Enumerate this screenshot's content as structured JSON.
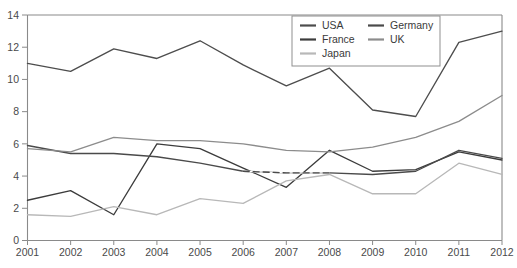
{
  "chart_data": {
    "type": "line",
    "title": "",
    "subtitle": "",
    "xlabel": "",
    "ylabel": "",
    "x": [
      2001,
      2002,
      2003,
      2004,
      2005,
      2006,
      2007,
      2008,
      2009,
      2010,
      2011,
      2012
    ],
    "xtick_labels": [
      "2001",
      "2002",
      "2003",
      "2004",
      "2005",
      "2006",
      "2007",
      "2008",
      "2009",
      "2010",
      "2011",
      "2012"
    ],
    "ytick_labels": [
      "0",
      "2",
      "4",
      "6",
      "8",
      "10",
      "12",
      "14"
    ],
    "yticks": [
      0,
      2,
      4,
      6,
      8,
      10,
      12,
      14
    ],
    "xlim": [
      2001,
      2012
    ],
    "ylim": [
      0,
      14
    ],
    "grid": false,
    "legend_position": "top-right",
    "legend_columns": 2,
    "series": [
      {
        "name": "USA",
        "color": "#4d4d4d",
        "dash": "none",
        "values": [
          11.0,
          10.5,
          11.9,
          11.3,
          12.4,
          10.9,
          9.6,
          10.7,
          8.1,
          7.7,
          12.3,
          13.0
        ]
      },
      {
        "name": "France",
        "color": "#3c3c3c",
        "dash": "none",
        "values": [
          2.5,
          3.1,
          1.6,
          6.0,
          5.7,
          4.5,
          3.3,
          5.6,
          4.3,
          4.4,
          5.5,
          5.0
        ]
      },
      {
        "name": "Japan",
        "color": "#b8b8b8",
        "dash": "none",
        "values": [
          1.6,
          1.5,
          2.1,
          1.6,
          2.6,
          2.3,
          3.7,
          4.1,
          2.9,
          2.9,
          4.8,
          4.1
        ]
      },
      {
        "name": "Germany",
        "color": "#4a4a4a",
        "dash": "segment-2006-2008",
        "values": [
          5.9,
          5.4,
          5.4,
          5.2,
          4.8,
          4.3,
          4.2,
          4.2,
          4.1,
          4.3,
          5.6,
          5.1
        ]
      },
      {
        "name": "UK",
        "color": "#8c8c8c",
        "dash": "none",
        "values": [
          5.7,
          5.5,
          6.4,
          6.2,
          6.2,
          6.0,
          5.6,
          5.5,
          5.8,
          6.4,
          7.4,
          9.0
        ]
      }
    ]
  },
  "legend": {
    "entries": [
      {
        "label": "USA",
        "color": "#4d4d4d"
      },
      {
        "label": "Germany",
        "color": "#4a4a4a"
      },
      {
        "label": "France",
        "color": "#3c3c3c"
      },
      {
        "label": "UK",
        "color": "#8c8c8c"
      },
      {
        "label": "Japan",
        "color": "#b8b8b8"
      }
    ]
  }
}
